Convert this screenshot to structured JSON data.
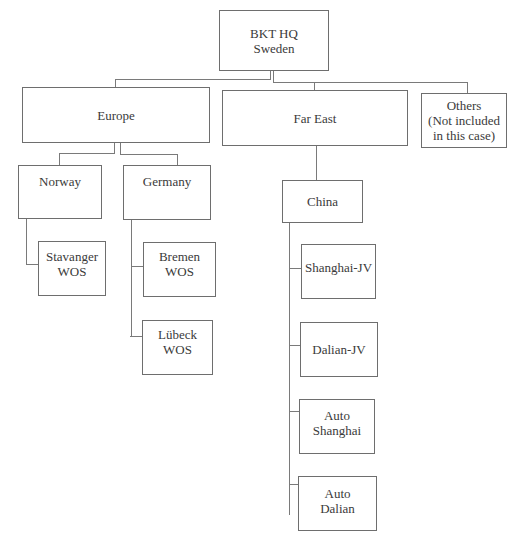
{
  "diagram": {
    "type": "org-chart",
    "nodes": {
      "hq": {
        "label": "BKT HQ\nSweden"
      },
      "europe": {
        "label": "Europe"
      },
      "far_east": {
        "label": "Far East"
      },
      "others": {
        "label": "Others\n(Not included\nin this case)"
      },
      "norway": {
        "label": "Norway"
      },
      "germany": {
        "label": "Germany"
      },
      "stavanger": {
        "label": "Stavanger\nWOS"
      },
      "bremen": {
        "label": "Bremen\nWOS"
      },
      "lubeck": {
        "label": "Lübeck\nWOS"
      },
      "china": {
        "label": "China"
      },
      "shanghai_jv": {
        "label": "Shanghai-JV"
      },
      "dalian_jv": {
        "label": "Dalian-JV"
      },
      "auto_shanghai": {
        "label": "Auto\nShanghai"
      },
      "auto_dalian": {
        "label": "Auto\nDalian"
      }
    },
    "edges": [
      [
        "hq",
        "europe"
      ],
      [
        "hq",
        "far_east"
      ],
      [
        "hq",
        "others"
      ],
      [
        "europe",
        "norway"
      ],
      [
        "europe",
        "germany"
      ],
      [
        "norway",
        "stavanger"
      ],
      [
        "germany",
        "bremen"
      ],
      [
        "germany",
        "lubeck"
      ],
      [
        "far_east",
        "china"
      ],
      [
        "china",
        "shanghai_jv"
      ],
      [
        "china",
        "dalian_jv"
      ],
      [
        "china",
        "auto_shanghai"
      ],
      [
        "china",
        "auto_dalian"
      ]
    ]
  }
}
